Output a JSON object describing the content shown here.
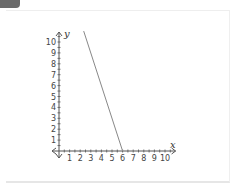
{
  "chart_data": {
    "type": "line",
    "title": "",
    "xlabel": "x",
    "ylabel": "y",
    "xlim": [
      0,
      10.5
    ],
    "ylim": [
      0,
      11
    ],
    "x_ticks": [
      1,
      2,
      3,
      4,
      5,
      6,
      7,
      8,
      9,
      10
    ],
    "y_ticks": [
      1,
      2,
      3,
      4,
      5,
      6,
      7,
      8,
      9,
      10
    ],
    "grid": false,
    "legend": null,
    "series": [
      {
        "name": "line",
        "x": [
          2.33,
          6
        ],
        "y": [
          11,
          0
        ],
        "color": "#888888"
      }
    ]
  },
  "axes": {
    "x_label": "x",
    "y_label": "y"
  }
}
